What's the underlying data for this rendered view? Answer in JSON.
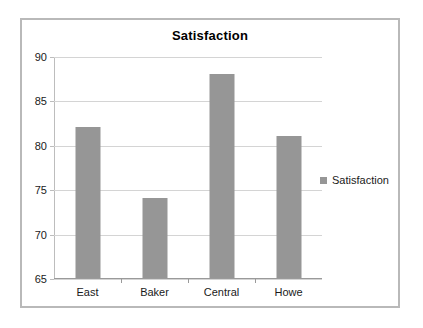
{
  "chart_data": {
    "type": "bar",
    "title": "Satisfaction",
    "categories": [
      "East",
      "Baker",
      "Central",
      "Howe"
    ],
    "values": [
      82,
      74,
      88,
      81
    ],
    "series": [
      {
        "name": "Satisfaction",
        "values": [
          82,
          74,
          88,
          81
        ]
      }
    ],
    "xlabel": "",
    "ylabel": "",
    "ylim": [
      65,
      90
    ],
    "yticks": [
      65,
      70,
      75,
      80,
      85,
      90
    ],
    "ytick_labels": [
      "65",
      "70",
      "75",
      "80",
      "85",
      "90"
    ],
    "grid": true,
    "legend": {
      "position": "right",
      "entries": [
        "Satisfaction"
      ]
    },
    "colors": {
      "bar": "#969696",
      "gridline": "#d4d4d4",
      "axis": "#9a9a9a",
      "border": "#b9b9b9",
      "background": "#ffffff",
      "text": "#1a1a1a"
    }
  }
}
